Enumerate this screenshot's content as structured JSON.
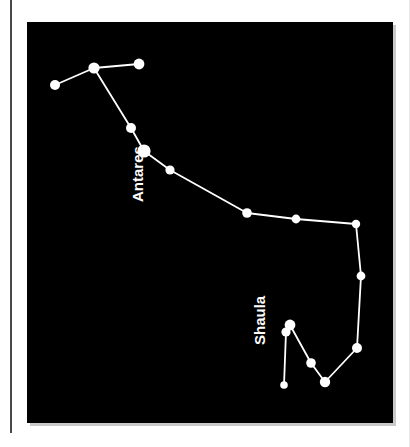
{
  "figure": {
    "kind": "constellation-star-chart",
    "constellation": "Scorpius",
    "background_color": "#000000",
    "page_color": "#ffffff",
    "star_color": "#ffffff",
    "line_color": "#ffffff"
  },
  "labels": [
    {
      "id": "antares",
      "text": "Antares",
      "x": 116,
      "y": 180,
      "rotation": -90,
      "color": "#ffffff"
    },
    {
      "id": "shaula",
      "text": "Shaula",
      "x": 238,
      "y": 323,
      "rotation": -90,
      "color": "#ffffff"
    }
  ],
  "chart_data": {
    "type": "scatter",
    "xlabel": "",
    "ylabel": "",
    "grid": false,
    "legend": "none",
    "xlim": [
      0,
      366
    ],
    "ylim": [
      0,
      401
    ],
    "note": "Star positions are panel-relative pixel coordinates; radius is relative apparent brightness.",
    "stars": [
      {
        "id": "s1",
        "name": "",
        "x": 28,
        "y": 63,
        "r": 5.0
      },
      {
        "id": "s2",
        "name": "",
        "x": 67,
        "y": 46,
        "r": 5.6
      },
      {
        "id": "s3",
        "name": "",
        "x": 112,
        "y": 42,
        "r": 5.4
      },
      {
        "id": "s4",
        "name": "",
        "x": 104,
        "y": 106,
        "r": 5.0
      },
      {
        "id": "s5",
        "name": "Antares",
        "x": 117,
        "y": 129,
        "r": 6.6
      },
      {
        "id": "s6",
        "name": "",
        "x": 143,
        "y": 148,
        "r": 4.6
      },
      {
        "id": "s7",
        "name": "",
        "x": 220,
        "y": 191,
        "r": 4.8
      },
      {
        "id": "s8",
        "name": "",
        "x": 269,
        "y": 197,
        "r": 4.4
      },
      {
        "id": "s9",
        "name": "",
        "x": 329,
        "y": 202,
        "r": 4.2
      },
      {
        "id": "s10",
        "name": "",
        "x": 334,
        "y": 254,
        "r": 4.4
      },
      {
        "id": "s11",
        "name": "",
        "x": 330,
        "y": 326,
        "r": 5.0
      },
      {
        "id": "s12",
        "name": "",
        "x": 298,
        "y": 360,
        "r": 5.2
      },
      {
        "id": "s13",
        "name": "",
        "x": 284,
        "y": 341,
        "r": 4.8
      },
      {
        "id": "s14",
        "name": "Shaula",
        "x": 263,
        "y": 303,
        "r": 5.4
      },
      {
        "id": "s15",
        "name": "",
        "x": 259,
        "y": 310,
        "r": 4.6
      },
      {
        "id": "s16",
        "name": "",
        "x": 257,
        "y": 363,
        "r": 3.8
      }
    ],
    "links": [
      [
        "s1",
        "s2"
      ],
      [
        "s2",
        "s3"
      ],
      [
        "s2",
        "s4"
      ],
      [
        "s4",
        "s5"
      ],
      [
        "s5",
        "s6"
      ],
      [
        "s6",
        "s7"
      ],
      [
        "s7",
        "s8"
      ],
      [
        "s8",
        "s9"
      ],
      [
        "s9",
        "s10"
      ],
      [
        "s10",
        "s11"
      ],
      [
        "s11",
        "s12"
      ],
      [
        "s12",
        "s13"
      ],
      [
        "s13",
        "s14"
      ],
      [
        "s15",
        "s16"
      ]
    ]
  }
}
